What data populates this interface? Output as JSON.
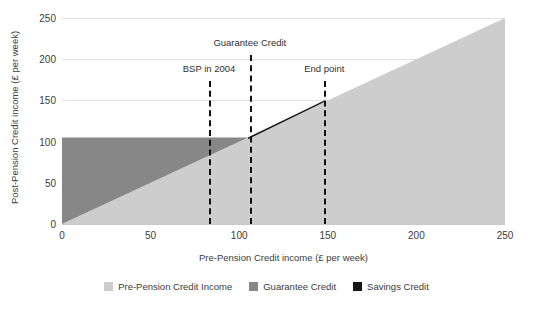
{
  "chart_data": {
    "type": "area",
    "title": "",
    "xlabel": "Pre-Pension Credit income (£ per week)",
    "ylabel": "Post-Pension Credit income (£ per week)",
    "xlim": [
      0,
      250
    ],
    "ylim": [
      0,
      250
    ],
    "xticks": [
      0,
      50,
      100,
      150,
      200,
      250
    ],
    "yticks": [
      0,
      50,
      100,
      150,
      200,
      250
    ],
    "xtick_labels": [
      "0",
      "50",
      "100",
      "150",
      "200",
      "250"
    ],
    "ytick_labels": [
      "0",
      "50",
      "100",
      "150",
      "200",
      "250"
    ],
    "grid": "horizontal",
    "legend_position": "bottom-center",
    "series": [
      {
        "name": "Pre-Pension Credit Income",
        "color": "#cdcdcd",
        "description": "Income carried through unchanged: y = x",
        "points": [
          [
            0,
            0
          ],
          [
            250,
            250
          ]
        ]
      },
      {
        "name": "Guarantee Credit",
        "color": "#878787",
        "description": "Tops income up to the guarantee level of 105 per week",
        "points": [
          [
            0,
            105
          ],
          [
            105,
            105
          ]
        ]
      },
      {
        "name": "Savings Credit",
        "color": "#161616",
        "description": "Wedge of extra credit between the guarantee level and the end point",
        "points": [
          [
            105,
            105
          ],
          [
            148,
            150
          ],
          [
            148,
            148
          ]
        ]
      }
    ],
    "annotations": [
      {
        "label": "BSP in 2004",
        "x": 83,
        "label_y": 73
      },
      {
        "label": "Guarantee Credit",
        "x": 106,
        "label_y": 47
      },
      {
        "label": "End point",
        "x": 148,
        "label_y": 73
      }
    ],
    "legend": [
      {
        "label": "Pre-Pension Credit Income",
        "color": "#cdcdcd"
      },
      {
        "label": "Guarantee Credit",
        "color": "#878787"
      },
      {
        "label": "Savings Credit",
        "color": "#161616"
      }
    ]
  }
}
